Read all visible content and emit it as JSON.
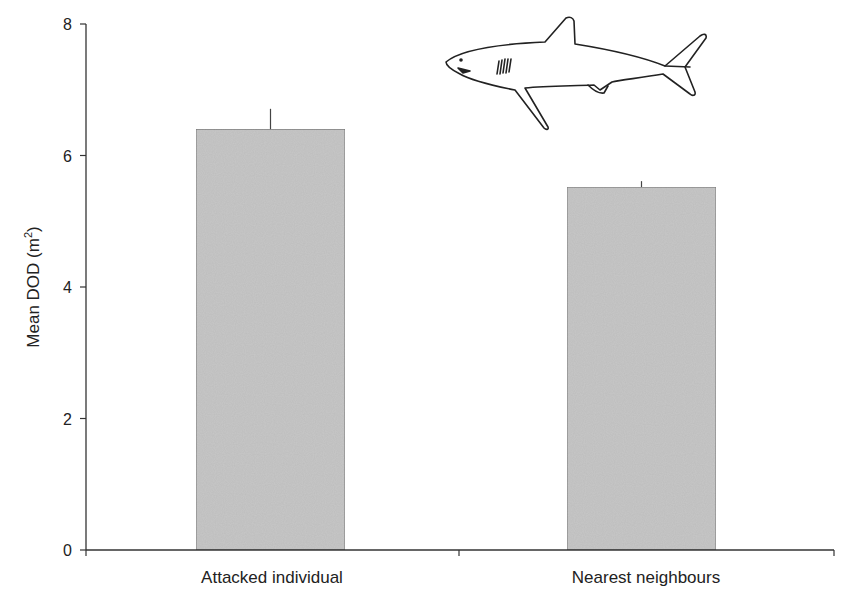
{
  "chart_data": {
    "type": "bar",
    "title": "",
    "xlabel": "",
    "ylabel": "Mean DOD (m",
    "ylabel_sup": "2",
    "ylabel_close": ")",
    "categories": [
      "Attacked individual",
      "Nearest neighbours"
    ],
    "values": [
      6.4,
      5.52
    ],
    "error_bars": [
      0.31,
      0.09
    ],
    "ylim": [
      0,
      8
    ],
    "yticks": [
      0,
      2,
      4,
      6,
      8
    ],
    "ytick_labels": [
      "0",
      "2",
      "4",
      "6",
      "8"
    ],
    "grid": false,
    "legend": null,
    "bar_color": "#c8c8c8",
    "bar_edge_color": "#7a7a7a",
    "annotation": "shark-illustration"
  }
}
